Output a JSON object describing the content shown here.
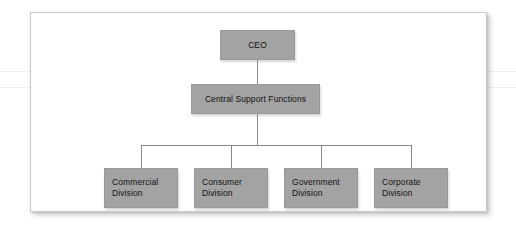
{
  "figure": {
    "type": "organizational-chart",
    "title": "",
    "background_color": "#ffffff",
    "frame_border_color": "#c9c9c9",
    "node_fill_color": "#a3a3a3",
    "node_border_color": "#999999",
    "connector_color": "#8a8a8a",
    "text_color": "#111111"
  },
  "chart_data": {
    "type": "diagram",
    "diagram_type": "organizational-chart",
    "orientation": "top-down",
    "levels": 3,
    "nodes": [
      {
        "id": "ceo",
        "label": "CEO",
        "level": 1,
        "parent": null
      },
      {
        "id": "central",
        "label": "Central Support Functions",
        "level": 2,
        "parent": "ceo"
      },
      {
        "id": "commercial",
        "label": "Commercial\nDivision",
        "level": 3,
        "parent": "central"
      },
      {
        "id": "consumer",
        "label": "Consumer\nDivision",
        "level": 3,
        "parent": "central"
      },
      {
        "id": "government",
        "label": "Government\nDivision",
        "level": 3,
        "parent": "central"
      },
      {
        "id": "corporate",
        "label": "Corporate\nDivision",
        "level": 3,
        "parent": "central"
      }
    ],
    "edges": [
      {
        "from": "ceo",
        "to": "central"
      },
      {
        "from": "central",
        "to": "commercial"
      },
      {
        "from": "central",
        "to": "consumer"
      },
      {
        "from": "central",
        "to": "government"
      },
      {
        "from": "central",
        "to": "corporate"
      }
    ]
  },
  "nodes": {
    "ceo": {
      "label": "CEO"
    },
    "central": {
      "label": "Central Support Functions"
    },
    "commercial": {
      "label": "Commercial\nDivision"
    },
    "consumer": {
      "label": "Consumer\nDivision"
    },
    "government": {
      "label": "Government\nDivision"
    },
    "corporate": {
      "label": "Corporate\nDivision"
    }
  }
}
